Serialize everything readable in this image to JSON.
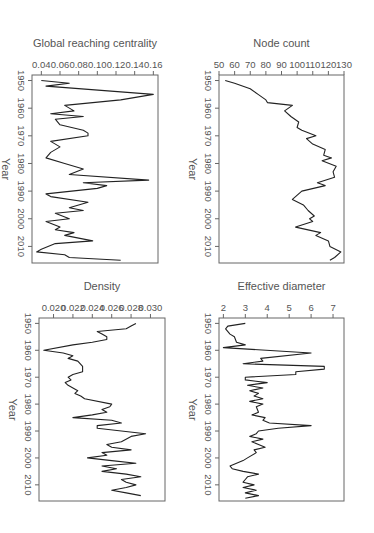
{
  "figure": {
    "orientation": "rotated-90-clockwise",
    "line_color": "#222222",
    "axis_color": "#666666",
    "text_color": "#555555"
  },
  "chart_data": [
    {
      "id": "node-count",
      "type": "line",
      "title": "",
      "xlabel": "Year",
      "ylabel": "Node count",
      "xlim": [
        1948,
        2016
      ],
      "ylim": [
        50,
        130
      ],
      "xticks": [
        1950,
        1960,
        1970,
        1980,
        1990,
        2000,
        2010
      ],
      "yticks": [
        50,
        60,
        70,
        80,
        90,
        100,
        110,
        120,
        130
      ],
      "ytick_labels": [
        "50",
        "60",
        "70",
        "80",
        "90",
        "100",
        "110",
        "120",
        "130"
      ],
      "grid": false,
      "x": [
        1950,
        1951,
        1953,
        1955,
        1957,
        1958,
        1959,
        1961,
        1963,
        1965,
        1967,
        1968,
        1970,
        1971,
        1973,
        1975,
        1977,
        1978,
        1979,
        1981,
        1983,
        1985,
        1987,
        1988,
        1990,
        1993,
        1995,
        1997,
        1999,
        2000,
        2001,
        2003,
        2005,
        2006,
        2008,
        2010,
        2012,
        2014,
        2015
      ],
      "y": [
        54,
        60,
        70,
        75,
        80,
        81,
        97,
        92,
        96,
        101,
        100,
        103,
        112,
        106,
        110,
        118,
        117,
        122,
        116,
        125,
        123,
        124,
        113,
        118,
        103,
        97,
        104,
        107,
        111,
        108,
        110,
        99,
        115,
        112,
        120,
        121,
        128,
        124,
        121
      ]
    },
    {
      "id": "global-reaching-centrality",
      "type": "line",
      "title": "",
      "xlabel": "Year",
      "ylabel": "Global reaching centrality",
      "xlim": [
        1948,
        2016
      ],
      "ylim": [
        0.03,
        0.165
      ],
      "xticks": [
        1950,
        1960,
        1970,
        1980,
        1990,
        2000,
        2010
      ],
      "yticks": [
        0.04,
        0.06,
        0.08,
        0.1,
        0.12,
        0.14,
        0.16
      ],
      "ytick_labels": [
        "0.04",
        "0.06",
        "0.08",
        "0.10",
        "0.12",
        "0.14",
        "0.16"
      ],
      "grid": false,
      "x": [
        1950,
        1951,
        1952,
        1955,
        1957,
        1959,
        1961,
        1962,
        1963,
        1964,
        1966,
        1968,
        1969,
        1970,
        1972,
        1974,
        1976,
        1978,
        1980,
        1982,
        1984,
        1986,
        1987,
        1988,
        1989,
        1991,
        1992,
        1994,
        1996,
        1997,
        1998,
        2000,
        2001,
        2003,
        2004,
        2005,
        2006,
        2008,
        2009,
        2011,
        2012,
        2013,
        2014,
        2015
      ],
      "y": [
        0.04,
        0.07,
        0.045,
        0.16,
        0.125,
        0.065,
        0.075,
        0.05,
        0.085,
        0.055,
        0.06,
        0.085,
        0.09,
        0.09,
        0.05,
        0.06,
        0.05,
        0.045,
        0.065,
        0.085,
        0.07,
        0.155,
        0.085,
        0.11,
        0.1,
        0.045,
        0.05,
        0.09,
        0.07,
        0.085,
        0.055,
        0.07,
        0.045,
        0.06,
        0.055,
        0.075,
        0.065,
        0.095,
        0.055,
        0.04,
        0.035,
        0.065,
        0.07,
        0.125
      ]
    },
    {
      "id": "effective-diameter",
      "type": "line",
      "title": "",
      "xlabel": "Year",
      "ylabel": "Effective diameter",
      "xlim": [
        1948,
        2016
      ],
      "ylim": [
        1.8,
        7.5
      ],
      "xticks": [
        1950,
        1960,
        1970,
        1980,
        1990,
        2000,
        2010
      ],
      "yticks": [
        2,
        3,
        4,
        5,
        6,
        7
      ],
      "ytick_labels": [
        "2",
        "3",
        "4",
        "5",
        "6",
        "7"
      ],
      "grid": false,
      "x": [
        1950,
        1951,
        1952,
        1954,
        1955,
        1957,
        1958,
        1959,
        1961,
        1963,
        1964,
        1965,
        1966,
        1967,
        1968,
        1969,
        1970,
        1971,
        1972,
        1973,
        1974,
        1975,
        1976,
        1977,
        1978,
        1979,
        1980,
        1981,
        1983,
        1984,
        1985,
        1986,
        1987,
        1988,
        1989,
        1990,
        1991,
        1992,
        1993,
        1994,
        1996,
        1997,
        1998,
        2000,
        2001,
        2003,
        2004,
        2005,
        2006,
        2007,
        2008,
        2009,
        2010,
        2011,
        2012,
        2013,
        2014,
        2015
      ],
      "y": [
        3.0,
        2.2,
        2.1,
        2.3,
        2.5,
        2.6,
        3.0,
        2.0,
        6.0,
        3.7,
        3.8,
        2.9,
        6.6,
        6.6,
        5.3,
        5.3,
        3.0,
        3.0,
        4.0,
        3.1,
        3.8,
        3.2,
        3.6,
        3.4,
        3.8,
        3.2,
        3.8,
        3.5,
        3.6,
        3.3,
        3.9,
        3.8,
        4.1,
        6.0,
        4.5,
        3.6,
        3.5,
        3.2,
        3.8,
        3.3,
        3.9,
        3.4,
        3.5,
        3.1,
        2.9,
        2.3,
        2.4,
        2.9,
        3.6,
        3.1,
        3.0,
        2.9,
        3.4,
        2.9,
        3.5,
        3.0,
        3.6,
        3.0
      ]
    },
    {
      "id": "density",
      "type": "line",
      "title": "",
      "xlabel": "Year",
      "ylabel": "Density",
      "xlim": [
        1948,
        2016
      ],
      "ylim": [
        0.0185,
        0.0315
      ],
      "xticks": [
        1950,
        1960,
        1970,
        1980,
        1990,
        2000,
        2010
      ],
      "yticks": [
        0.02,
        0.022,
        0.024,
        0.026,
        0.028,
        0.03
      ],
      "ytick_labels": [
        "0.020",
        "0.022",
        "0.024",
        "0.026",
        "0.028",
        "0.030"
      ],
      "grid": false,
      "x": [
        1950,
        1951,
        1952,
        1953,
        1954,
        1955,
        1956,
        1957,
        1958,
        1960,
        1961,
        1962,
        1963,
        1964,
        1966,
        1968,
        1969,
        1970,
        1971,
        1972,
        1973,
        1975,
        1976,
        1977,
        1978,
        1980,
        1981,
        1982,
        1983,
        1984,
        1985,
        1986,
        1987,
        1988,
        1989,
        1991,
        1992,
        1994,
        1995,
        1996,
        1997,
        1998,
        1999,
        2000,
        2001,
        2002,
        2003,
        2004,
        2005,
        2006,
        2007,
        2008,
        2009,
        2010,
        2011,
        2012,
        2013,
        2014
      ],
      "y": [
        0.0285,
        0.028,
        0.0275,
        0.0245,
        0.025,
        0.0255,
        0.0255,
        0.024,
        0.022,
        0.019,
        0.021,
        0.022,
        0.0215,
        0.0225,
        0.023,
        0.023,
        0.022,
        0.0215,
        0.0218,
        0.0212,
        0.0215,
        0.0225,
        0.0222,
        0.0228,
        0.0232,
        0.026,
        0.0258,
        0.025,
        0.0255,
        0.024,
        0.022,
        0.026,
        0.027,
        0.0245,
        0.0245,
        0.0295,
        0.028,
        0.027,
        0.0255,
        0.026,
        0.028,
        0.025,
        0.0255,
        0.0235,
        0.026,
        0.0285,
        0.025,
        0.0265,
        0.025,
        0.0275,
        0.029,
        0.027,
        0.0275,
        0.0285,
        0.0275,
        0.026,
        0.0275,
        0.029
      ]
    }
  ]
}
